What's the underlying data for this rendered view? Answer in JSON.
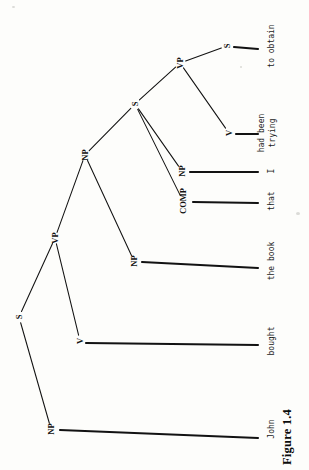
{
  "figure": {
    "caption": "Figure 1.4",
    "orientation": "rotated-90-ccw",
    "ink_color": "#121212",
    "page_color": "#fdfdfb"
  },
  "tree": {
    "nodes": [
      {
        "id": "S1",
        "label": "S",
        "x": 19,
        "y": 317
      },
      {
        "id": "NP1",
        "label": "NP",
        "x": 51,
        "y": 429
      },
      {
        "id": "VP1",
        "label": "VP",
        "x": 55,
        "y": 238
      },
      {
        "id": "V1",
        "label": "V",
        "x": 80,
        "y": 341
      },
      {
        "id": "NP2",
        "label": "NP",
        "x": 85,
        "y": 155
      },
      {
        "id": "NP3",
        "label": "NP",
        "x": 134,
        "y": 261
      },
      {
        "id": "S2",
        "label": "S",
        "x": 135,
        "y": 104
      },
      {
        "id": "COMP1",
        "label": "COMP",
        "x": 183,
        "y": 201
      },
      {
        "id": "NP4",
        "label": "NP",
        "x": 182,
        "y": 171
      },
      {
        "id": "VP2",
        "label": "VP",
        "x": 180,
        "y": 63
      },
      {
        "id": "V2",
        "label": "V",
        "x": 229,
        "y": 133
      },
      {
        "id": "S3",
        "label": "S",
        "x": 227,
        "y": 46
      }
    ],
    "edges": [
      {
        "from": "S1",
        "to": "NP1",
        "weight": "thin"
      },
      {
        "from": "S1",
        "to": "VP1",
        "weight": "thin"
      },
      {
        "from": "VP1",
        "to": "V1",
        "weight": "thin"
      },
      {
        "from": "VP1",
        "to": "NP2",
        "weight": "thin"
      },
      {
        "from": "NP2",
        "to": "NP3",
        "weight": "thin"
      },
      {
        "from": "NP2",
        "to": "S2",
        "weight": "thin"
      },
      {
        "from": "S2",
        "to": "COMP1",
        "weight": "thin"
      },
      {
        "from": "S2",
        "to": "NP4",
        "weight": "thin"
      },
      {
        "from": "S2",
        "to": "VP2",
        "weight": "thin"
      },
      {
        "from": "VP2",
        "to": "V2",
        "weight": "thin"
      },
      {
        "from": "VP2",
        "to": "S3",
        "weight": "thin"
      }
    ],
    "leaves": [
      {
        "id": "L-john",
        "parent": "NP1",
        "text": "John",
        "x": 272,
        "y": 429,
        "line_from_x": 60,
        "line_from_y": 430,
        "line_to_x": 258,
        "line_to_y": 438
      },
      {
        "id": "L-bought",
        "parent": "V1",
        "text": "bought",
        "x": 272,
        "y": 341,
        "line_from_x": 86,
        "line_from_y": 343,
        "line_to_x": 258,
        "line_to_y": 345
      },
      {
        "id": "L-thebook",
        "parent": "NP3",
        "text": "the book",
        "x": 272,
        "y": 261,
        "line_from_x": 142,
        "line_from_y": 262,
        "line_to_x": 258,
        "line_to_y": 268
      },
      {
        "id": "L-that",
        "parent": "COMP1",
        "text": "that",
        "x": 272,
        "y": 201,
        "line_from_x": 193,
        "line_from_y": 202,
        "line_to_x": 258,
        "line_to_y": 203
      },
      {
        "id": "L-i",
        "parent": "NP4",
        "text": "I",
        "x": 272,
        "y": 171,
        "line_from_x": 190,
        "line_from_y": 172,
        "line_to_x": 258,
        "line_to_y": 172
      },
      {
        "id": "L-trying",
        "parent": "V2",
        "text": "had been\ntrying",
        "x": 268,
        "y": 133,
        "line_from_x": 236,
        "line_from_y": 134,
        "line_to_x": 258,
        "line_to_y": 134
      },
      {
        "id": "L-obtain",
        "parent": "S3",
        "text": "to obtain",
        "x": 272,
        "y": 46,
        "line_from_x": 234,
        "line_from_y": 47,
        "line_to_x": 258,
        "line_to_y": 49
      }
    ]
  }
}
